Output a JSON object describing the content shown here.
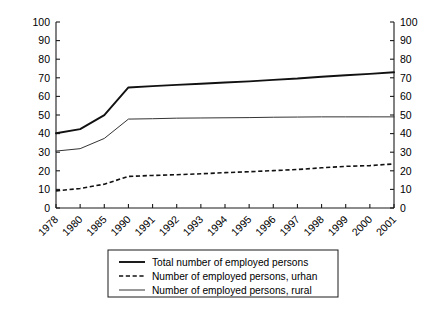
{
  "chart_data": {
    "type": "line",
    "title": "",
    "xlabel": "",
    "ylabel": "",
    "ylim": [
      0,
      100
    ],
    "y_ticks": [
      0,
      10,
      20,
      30,
      40,
      50,
      60,
      70,
      80,
      90,
      100
    ],
    "y_tick_labels": [
      "0",
      "10",
      "20",
      "30",
      "40",
      "50",
      "60",
      "70",
      "80",
      "90",
      "100"
    ],
    "dual_axis": true,
    "right_axis_ticks": [
      0,
      10,
      20,
      30,
      40,
      50,
      60,
      70,
      80,
      90,
      100
    ],
    "right_axis_tick_labels": [
      "0",
      "10",
      "20",
      "30",
      "40",
      "50",
      "60",
      "70",
      "80",
      "90",
      "100"
    ],
    "grid": false,
    "legend_position": "below-plot",
    "x_tick_rotation": 45,
    "categories": [
      "1978",
      "1980",
      "1985",
      "1990",
      "1991",
      "1992",
      "1993",
      "1994",
      "1995",
      "1996",
      "1997",
      "1998",
      "1999",
      "2000",
      "2001"
    ],
    "series": [
      {
        "name": "Total number of employed persons",
        "style": "solid-thick",
        "values": [
          40.2,
          42.4,
          49.9,
          64.8,
          65.5,
          66.2,
          66.8,
          67.5,
          68.1,
          68.9,
          69.6,
          70.6,
          71.4,
          72.1,
          73.0
        ]
      },
      {
        "name": "Number of employed persons, urban",
        "style": "dashed",
        "values": [
          9.2,
          10.5,
          12.8,
          17.0,
          17.5,
          17.9,
          18.4,
          19.0,
          19.5,
          20.1,
          20.7,
          21.6,
          22.4,
          22.8,
          23.7
        ]
      },
      {
        "name": "Number of employed persons, rural",
        "style": "solid-thin",
        "values": [
          30.6,
          31.9,
          37.4,
          47.8,
          48.0,
          48.3,
          48.4,
          48.5,
          48.6,
          48.8,
          48.9,
          49.0,
          49.0,
          49.0,
          49.0
        ]
      }
    ]
  },
  "legend": {
    "items": [
      {
        "label": "Total number of employed persons",
        "marker": "solid-thick-line-icon"
      },
      {
        "label": "Number of employed persons, urhan",
        "marker": "dashed-line-icon"
      },
      {
        "label": "Number of employed persons, rural",
        "marker": "solid-thin-line-icon"
      }
    ]
  }
}
